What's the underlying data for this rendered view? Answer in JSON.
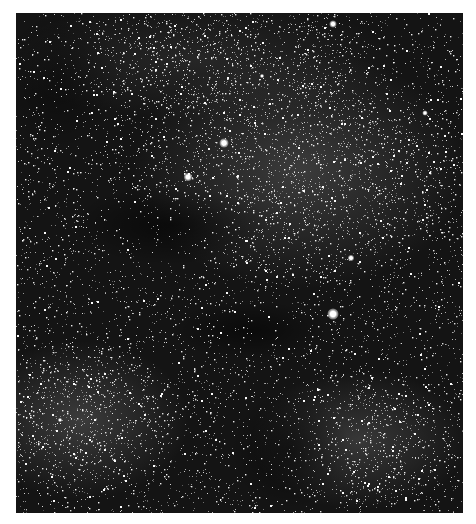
{
  "image": {
    "subject": "Milky Way starfield with dark nebula lanes",
    "style": "grayscale",
    "frame": {
      "x": 16,
      "y": 13,
      "width": 447,
      "height": 500,
      "border_color": "#ffffff"
    },
    "colors": {
      "sky": "#141414",
      "dark_lane": "#0a0a0a",
      "dense_region": "#3a3a3a",
      "star": "#ffffff"
    }
  },
  "bright_stars": [
    {
      "x": 333,
      "y": 24,
      "size": 7
    },
    {
      "x": 224,
      "y": 143,
      "size": 9
    },
    {
      "x": 188,
      "y": 177,
      "size": 8
    },
    {
      "x": 425,
      "y": 113,
      "size": 5
    },
    {
      "x": 333,
      "y": 314,
      "size": 11
    },
    {
      "x": 351,
      "y": 258,
      "size": 6
    },
    {
      "x": 262,
      "y": 76,
      "size": 4
    },
    {
      "x": 60,
      "y": 420,
      "size": 4
    }
  ],
  "dense_regions": [
    {
      "x": 300,
      "y": 170,
      "rx": 170,
      "ry": 120,
      "opacity": 0.22
    },
    {
      "x": 80,
      "y": 420,
      "rx": 110,
      "ry": 80,
      "opacity": 0.22
    },
    {
      "x": 360,
      "y": 440,
      "rx": 110,
      "ry": 70,
      "opacity": 0.2
    },
    {
      "x": 200,
      "y": 60,
      "rx": 200,
      "ry": 60,
      "opacity": 0.1
    }
  ],
  "dark_lanes": [
    {
      "x": 170,
      "y": 225,
      "rx": 100,
      "ry": 40,
      "opacity": 0.55
    },
    {
      "x": 250,
      "y": 330,
      "rx": 80,
      "ry": 30,
      "opacity": 0.5
    },
    {
      "x": 290,
      "y": 450,
      "rx": 60,
      "ry": 60,
      "opacity": 0.45
    },
    {
      "x": 60,
      "y": 80,
      "rx": 60,
      "ry": 70,
      "opacity": 0.35
    }
  ],
  "starfield": {
    "count": 9000,
    "seed": 42
  }
}
